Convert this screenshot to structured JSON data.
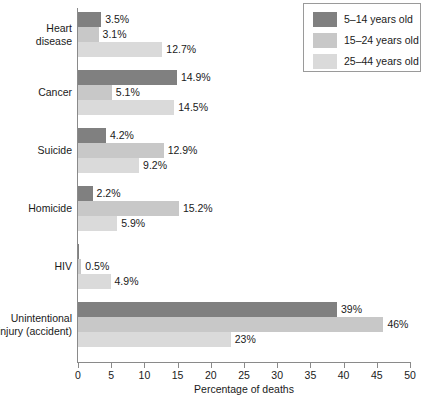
{
  "chart_data": {
    "type": "bar",
    "orientation": "horizontal",
    "title": "",
    "xlabel": "Percentage of deaths",
    "ylabel": "",
    "xlim": [
      0,
      50
    ],
    "xticks": [
      0,
      5,
      10,
      15,
      20,
      25,
      30,
      35,
      40,
      45,
      50
    ],
    "xtick_labels": [
      "0",
      "5",
      "10",
      "15",
      "20",
      "25",
      "30",
      "35",
      "40",
      "45",
      "50"
    ],
    "grid": false,
    "legend_position": "top-right",
    "categories": [
      "Heart disease",
      "Cancer",
      "Suicide",
      "Homicide",
      "HIV",
      "Unintentional injury (accident)"
    ],
    "category_lines": [
      [
        "Heart",
        "disease"
      ],
      [
        "Cancer"
      ],
      [
        "Suicide"
      ],
      [
        "Homicide"
      ],
      [
        "HIV"
      ],
      [
        "Unintentional",
        "injury (accident)"
      ]
    ],
    "series": [
      {
        "name": "5–14 years old",
        "color": "#808080",
        "values": [
          3.5,
          14.9,
          4.2,
          2.2,
          0.2,
          39
        ],
        "labels": [
          "3.5%",
          "14.9%",
          "4.2%",
          "2.2%",
          "",
          "39%"
        ]
      },
      {
        "name": "15–24 years old",
        "color": "#c8c8c8",
        "values": [
          3.1,
          5.1,
          12.9,
          15.2,
          0.5,
          46
        ],
        "labels": [
          "3.1%",
          "5.1%",
          "12.9%",
          "15.2%",
          "0.5%",
          "46%"
        ]
      },
      {
        "name": "25–44 years old",
        "color": "#dadada",
        "values": [
          12.7,
          14.5,
          9.2,
          5.9,
          4.9,
          23
        ],
        "labels": [
          "12.7%",
          "14.5%",
          "9.2%",
          "5.9%",
          "4.9%",
          "23%"
        ]
      }
    ]
  },
  "legend": {
    "entries": [
      {
        "label": "5–14 years old",
        "color": "#808080"
      },
      {
        "label": "15–24 years old",
        "color": "#c8c8c8"
      },
      {
        "label": "25–44 years old",
        "color": "#dadada"
      }
    ]
  },
  "axis": {
    "x_title": "Percentage of deaths"
  }
}
